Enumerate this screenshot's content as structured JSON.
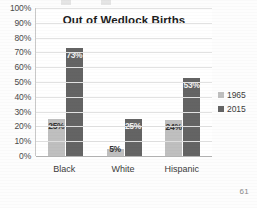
{
  "page": {
    "page_number": "61"
  },
  "chart_data": {
    "type": "bar",
    "title": "Out of Wedlock Births",
    "xlabel": "",
    "ylabel": "",
    "categories": [
      "Black",
      "White",
      "Hispanic"
    ],
    "series": [
      {
        "name": "1965",
        "color": "#bfbfbf",
        "values": [
          25,
          5,
          24
        ],
        "labels": [
          "25%",
          "5%",
          "24%"
        ]
      },
      {
        "name": "2015",
        "color": "#646464",
        "values": [
          73,
          25,
          53
        ],
        "labels": [
          "73%",
          "25%",
          "53%"
        ]
      }
    ],
    "ylim": [
      0,
      100
    ],
    "ytick_labels": [
      "100%",
      "90%",
      "80%",
      "70%",
      "60%",
      "50%",
      "40%",
      "30%",
      "20%",
      "10%",
      "0%"
    ],
    "ytick_values": [
      100,
      90,
      80,
      70,
      60,
      50,
      40,
      30,
      20,
      10,
      0
    ],
    "grid": true,
    "legend_position": "right"
  }
}
